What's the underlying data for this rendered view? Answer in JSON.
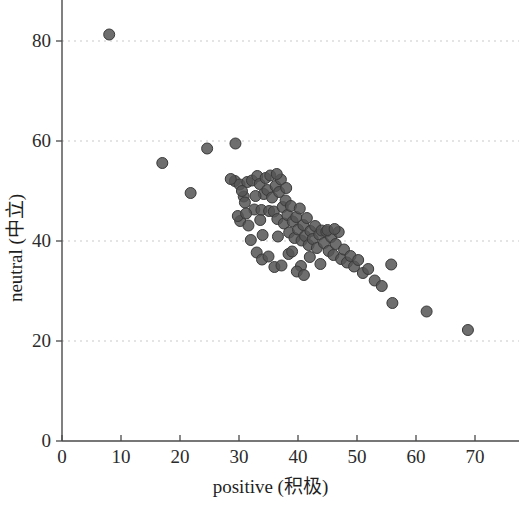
{
  "chart_data": {
    "type": "scatter",
    "title": "",
    "xlabel": "positive (积极)",
    "ylabel": "neutral (中立)",
    "xlim": [
      0,
      77
    ],
    "ylim": [
      0,
      88
    ],
    "xticks": [
      0,
      10,
      20,
      30,
      40,
      50,
      60,
      70
    ],
    "yticks": [
      0,
      20,
      40,
      60,
      80
    ],
    "xtick_labels": [
      "0",
      "10",
      "20",
      "30",
      "40",
      "50",
      "60",
      "70"
    ],
    "ytick_labels": [
      "0",
      "20",
      "40",
      "60",
      "80"
    ],
    "grid": "horizontal-dotted",
    "legend": "none",
    "marker": {
      "shape": "circle",
      "radius_px": 5.5,
      "fill": "#555555",
      "edge": "#3a3a3a",
      "opacity": 0.85
    },
    "points": [
      [
        8.0,
        81.3
      ],
      [
        17.0,
        55.6
      ],
      [
        21.8,
        49.6
      ],
      [
        24.6,
        58.5
      ],
      [
        29.4,
        59.5
      ],
      [
        29.3,
        52.0
      ],
      [
        30.1,
        51.3
      ],
      [
        30.8,
        48.9
      ],
      [
        31.0,
        47.7
      ],
      [
        31.4,
        51.8
      ],
      [
        32.2,
        52.1
      ],
      [
        32.6,
        46.3
      ],
      [
        33.1,
        53.0
      ],
      [
        33.5,
        51.4
      ],
      [
        33.8,
        46.2
      ],
      [
        34.2,
        49.4
      ],
      [
        34.5,
        52.6
      ],
      [
        34.8,
        50.2
      ],
      [
        35.1,
        46.0
      ],
      [
        35.3,
        53.1
      ],
      [
        35.6,
        48.7
      ],
      [
        35.9,
        45.9
      ],
      [
        36.2,
        51.0
      ],
      [
        36.5,
        44.4
      ],
      [
        36.8,
        49.8
      ],
      [
        37.1,
        52.3
      ],
      [
        37.4,
        46.8
      ],
      [
        37.6,
        43.5
      ],
      [
        37.9,
        48.1
      ],
      [
        38.2,
        45.2
      ],
      [
        38.5,
        41.7
      ],
      [
        38.8,
        47.0
      ],
      [
        39.1,
        43.9
      ],
      [
        39.4,
        40.6
      ],
      [
        39.7,
        44.8
      ],
      [
        40.0,
        42.3
      ],
      [
        40.3,
        46.5
      ],
      [
        40.6,
        40.1
      ],
      [
        40.9,
        43.2
      ],
      [
        41.2,
        41.0
      ],
      [
        41.5,
        44.6
      ],
      [
        41.8,
        39.2
      ],
      [
        42.1,
        42.0
      ],
      [
        42.5,
        40.4
      ],
      [
        42.9,
        43.0
      ],
      [
        43.2,
        38.6
      ],
      [
        43.6,
        41.3
      ],
      [
        44.0,
        42.1
      ],
      [
        44.4,
        39.6
      ],
      [
        44.8,
        41.9
      ],
      [
        45.2,
        38.0
      ],
      [
        45.6,
        40.8
      ],
      [
        46.0,
        37.2
      ],
      [
        46.4,
        39.4
      ],
      [
        46.9,
        41.8
      ],
      [
        47.3,
        36.4
      ],
      [
        47.8,
        38.3
      ],
      [
        48.3,
        35.7
      ],
      [
        48.9,
        37.0
      ],
      [
        49.5,
        34.9
      ],
      [
        50.2,
        36.2
      ],
      [
        51.0,
        33.6
      ],
      [
        51.9,
        34.4
      ],
      [
        53.0,
        32.1
      ],
      [
        54.2,
        31.0
      ],
      [
        55.8,
        35.3
      ],
      [
        56.0,
        27.6
      ],
      [
        61.8,
        25.9
      ],
      [
        68.8,
        22.2
      ],
      [
        30.2,
        44.0
      ],
      [
        31.6,
        43.1
      ],
      [
        33.0,
        37.7
      ],
      [
        33.9,
        36.3
      ],
      [
        35.0,
        36.9
      ],
      [
        36.0,
        34.8
      ],
      [
        37.2,
        35.1
      ],
      [
        38.4,
        37.4
      ],
      [
        32.0,
        40.2
      ],
      [
        34.0,
        41.2
      ],
      [
        36.6,
        40.9
      ],
      [
        39.0,
        37.9
      ],
      [
        40.5,
        35.0
      ],
      [
        42.0,
        36.8
      ],
      [
        43.8,
        35.4
      ],
      [
        28.6,
        52.4
      ],
      [
        30.5,
        50.0
      ],
      [
        32.8,
        49.0
      ],
      [
        36.4,
        53.4
      ],
      [
        38.0,
        50.6
      ],
      [
        29.8,
        45.0
      ],
      [
        31.2,
        45.5
      ],
      [
        33.6,
        44.2
      ],
      [
        45.0,
        42.2
      ],
      [
        46.2,
        42.4
      ],
      [
        39.8,
        33.9
      ],
      [
        41.0,
        33.2
      ]
    ]
  }
}
